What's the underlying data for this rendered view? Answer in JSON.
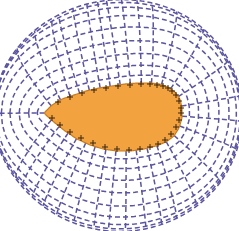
{
  "figure": {
    "kind": "computational-mesh-diagram",
    "width": 239,
    "height": 231,
    "background_color": "#ffffff"
  },
  "colors": {
    "background": "#ffffff",
    "mesh_line": "#5b55a0",
    "body_fill": "#f2a33f",
    "body_outline": "#c87a1e",
    "surface_marker": "#3a2410"
  },
  "style": {
    "mesh_line_width": 1.5,
    "mesh_dash_pattern": "5 3",
    "body_outline_width": 1.2,
    "marker_stroke_width": 1.0,
    "marker_size": 3.0
  },
  "chart_data": {
    "type": "scatter",
    "subtitle": "",
    "xlabel": "",
    "ylabel": "",
    "grid": true,
    "legend": null,
    "annotations": [],
    "xlim": [
      0,
      239
    ],
    "ylim": [
      0,
      231
    ],
    "body": {
      "name": "teardrop-body",
      "nose_point": [
        44,
        113
      ],
      "tail_center": [
        172,
        112
      ],
      "chord_length": 135,
      "max_thickness": 68,
      "fill": "#f2a33f",
      "outline": "#c87a1e",
      "description": "sharp nose at left, blunt rounded tail at right"
    },
    "body_outline_points": [
      [
        44,
        113
      ],
      [
        52,
        105
      ],
      [
        62,
        99
      ],
      [
        74,
        95
      ],
      [
        86,
        91
      ],
      [
        99,
        88
      ],
      [
        112,
        86
      ],
      [
        125,
        84
      ],
      [
        138,
        83
      ],
      [
        150,
        83
      ],
      [
        160,
        84
      ],
      [
        168,
        87
      ],
      [
        175,
        92
      ],
      [
        180,
        99
      ],
      [
        182,
        108
      ],
      [
        182,
        118
      ],
      [
        179,
        128
      ],
      [
        174,
        136
      ],
      [
        166,
        142
      ],
      [
        156,
        146
      ],
      [
        144,
        149
      ],
      [
        131,
        151
      ],
      [
        117,
        151
      ],
      [
        103,
        149
      ],
      [
        90,
        145
      ],
      [
        77,
        139
      ],
      [
        65,
        131
      ],
      [
        55,
        123
      ],
      [
        48,
        117
      ],
      [
        44,
        113
      ]
    ],
    "surface_markers_upper": [
      [
        58,
        102
      ],
      [
        70,
        97
      ],
      [
        82,
        93
      ],
      [
        94,
        90
      ],
      [
        106,
        88
      ],
      [
        118,
        86
      ],
      [
        130,
        85
      ],
      [
        141,
        84
      ],
      [
        150,
        84
      ],
      [
        157,
        85
      ],
      [
        163,
        86
      ],
      [
        168,
        88
      ],
      [
        172,
        91
      ],
      [
        176,
        95
      ],
      [
        179,
        101
      ],
      [
        181,
        108
      ]
    ],
    "surface_markers_lower": [
      [
        52,
        118
      ],
      [
        60,
        125
      ],
      [
        70,
        132
      ],
      [
        81,
        138
      ],
      [
        93,
        143
      ],
      [
        105,
        147
      ],
      [
        117,
        149
      ],
      [
        129,
        150
      ],
      [
        140,
        149
      ],
      [
        150,
        147
      ],
      [
        158,
        144
      ],
      [
        165,
        140
      ],
      [
        171,
        134
      ],
      [
        176,
        127
      ],
      [
        179,
        120
      ],
      [
        181,
        113
      ]
    ],
    "mesh": {
      "family_radial": {
        "name": "radial-grid-lines",
        "count": 32,
        "style": "dashed",
        "color": "#5b55a0",
        "description": "lines emanating outward normal to the body surface"
      },
      "family_circumferential": {
        "name": "circumferential-grid-lines",
        "count": 9,
        "style": "dashed",
        "color": "#5b55a0",
        "description": "closed loops surrounding the body at increasing offset"
      },
      "offsets": [
        7,
        15,
        24,
        34,
        46,
        59,
        73,
        89,
        106
      ],
      "outer_extent": {
        "rx": 112,
        "ry": 110,
        "cx": 119,
        "cy": 115
      }
    }
  }
}
